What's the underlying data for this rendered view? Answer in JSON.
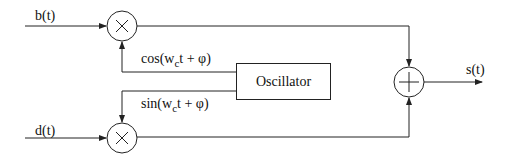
{
  "inputs": {
    "b": "b(t)",
    "d": "d(t)"
  },
  "output": "s(t)",
  "oscillator": {
    "label": "Oscillator"
  },
  "signals": {
    "cos": {
      "pre": "cos(w",
      "sub": "c",
      "post": "t + φ)"
    },
    "sin": {
      "pre": "sin(w",
      "sub": "c",
      "post": "t + φ)"
    }
  },
  "operators": {
    "multiply": "×",
    "add": "+"
  },
  "colors": {
    "line": "#222222",
    "background": "#ffffff"
  }
}
